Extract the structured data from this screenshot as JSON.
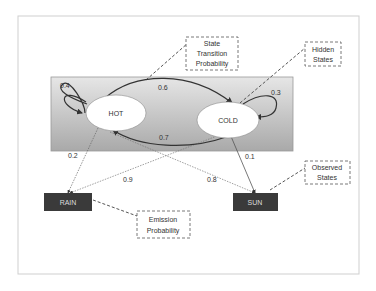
{
  "diagram": {
    "type": "hidden-markov-model",
    "hidden_states": [
      {
        "id": "hot",
        "label": "HOT"
      },
      {
        "id": "cold",
        "label": "COLD"
      }
    ],
    "observed_states": [
      {
        "id": "rain",
        "label": "RAIN"
      },
      {
        "id": "sun",
        "label": "SUN"
      }
    ],
    "transitions": [
      {
        "from": "hot",
        "to": "hot",
        "prob": "0.4"
      },
      {
        "from": "hot",
        "to": "cold",
        "prob": "0.6"
      },
      {
        "from": "cold",
        "to": "hot",
        "prob": "0.7"
      },
      {
        "from": "cold",
        "to": "cold",
        "prob": "0.3"
      }
    ],
    "emissions": [
      {
        "from": "hot",
        "to": "rain",
        "prob": "0.2"
      },
      {
        "from": "hot",
        "to": "sun",
        "prob": "0.8"
      },
      {
        "from": "cold",
        "to": "rain",
        "prob": "0.9"
      },
      {
        "from": "cold",
        "to": "sun",
        "prob": "0.1"
      }
    ],
    "callouts": {
      "state_transition": [
        "State",
        "Transition",
        "Probability"
      ],
      "hidden_states": [
        "Hidden",
        "States"
      ],
      "observed_states": [
        "Observed",
        "States"
      ],
      "emission": [
        "Emission",
        "Probability"
      ]
    },
    "colors": {
      "hidden_panel_top": "#e4e4e4",
      "hidden_panel_bottom": "#a8a8a8",
      "observed_fill": "#3a3a3a",
      "edge": "#444444"
    }
  }
}
